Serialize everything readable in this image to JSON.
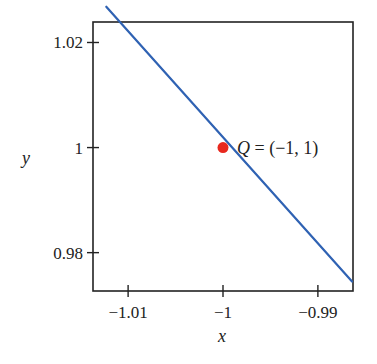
{
  "chart_data": {
    "type": "line",
    "title": "",
    "xlabel": "x",
    "ylabel": "y",
    "xlim": [
      -1.0137,
      -0.9863
    ],
    "ylim": [
      0.9727,
      1.0239
    ],
    "grid": false,
    "legend": null,
    "x_ticks": [
      -1.01,
      -1,
      -0.99
    ],
    "x_tick_labels": [
      "−1.01",
      "−1",
      "−0.99"
    ],
    "y_ticks": [
      0.98,
      1,
      1.02
    ],
    "y_tick_labels": [
      "0.98",
      "1",
      "1.02"
    ],
    "series": [
      {
        "name": "line y = -x",
        "color": "#2f62b3",
        "x": [
          -1.0123,
          -0.9864
        ],
        "y": [
          1.0268,
          0.9745
        ]
      }
    ],
    "points": [
      {
        "name": "Q",
        "x": -1,
        "y": 1,
        "color": "#e8281e",
        "label": "Q = (−1, 1)"
      }
    ],
    "annotations": [
      {
        "text": "Q = (−1, 1)",
        "x": -1,
        "y": 1
      }
    ]
  },
  "labels": {
    "xlabel": "x",
    "ylabel": "y",
    "point_q_letter": "Q",
    "point_q_rest": " = (−1, 1)"
  },
  "colors": {
    "line": "#2f62b3",
    "point": "#e8281e",
    "axis": "#222222"
  }
}
